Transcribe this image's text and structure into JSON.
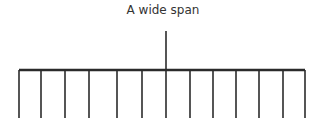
{
  "diagram": {
    "title": "A wide span",
    "line_color": "#2b2b2b",
    "beam": {
      "x1": 19,
      "x2": 305,
      "y": 70
    },
    "center_post": {
      "x": 166,
      "y_top": 31,
      "y_bottom": 118
    },
    "legs_x": [
      19,
      41,
      65,
      89,
      117,
      142,
      190,
      213,
      236,
      259,
      283,
      305
    ],
    "leg_bottom": 118
  }
}
